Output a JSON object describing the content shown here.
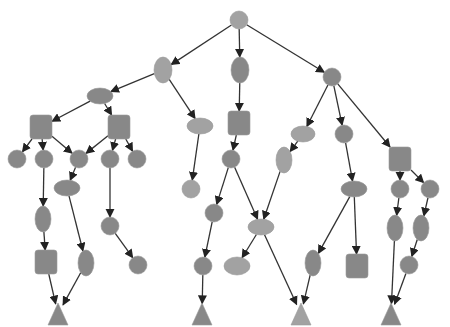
{
  "diagram": {
    "type": "tree",
    "colors": {
      "light": "#a2a2a2",
      "dark": "#888888",
      "edge": "#333333",
      "background": "#ffffff"
    },
    "nodes": [
      {
        "id": "root",
        "shape": "circle",
        "x": 239,
        "y": 20,
        "rx": 9,
        "ry": 9,
        "tone": "light"
      },
      {
        "id": "a",
        "shape": "ellipse",
        "x": 163,
        "y": 70,
        "rx": 9,
        "ry": 13,
        "tone": "light"
      },
      {
        "id": "b",
        "shape": "ellipse",
        "x": 240,
        "y": 70,
        "rx": 9,
        "ry": 13,
        "tone": "dark"
      },
      {
        "id": "c",
        "shape": "circle",
        "x": 332,
        "y": 77,
        "rx": 9,
        "ry": 9,
        "tone": "dark"
      },
      {
        "id": "a1",
        "shape": "ellipse",
        "x": 100,
        "y": 96,
        "rx": 13,
        "ry": 8,
        "tone": "dark"
      },
      {
        "id": "a2",
        "shape": "ellipse",
        "x": 200,
        "y": 126,
        "rx": 13,
        "ry": 8,
        "tone": "light"
      },
      {
        "id": "a1a",
        "shape": "square",
        "x": 41,
        "y": 127,
        "rx": 11,
        "ry": 12,
        "tone": "dark"
      },
      {
        "id": "a1b",
        "shape": "square",
        "x": 119,
        "y": 127,
        "rx": 11,
        "ry": 12,
        "tone": "dark"
      },
      {
        "id": "l1",
        "shape": "circle",
        "x": 17,
        "y": 159,
        "rx": 9,
        "ry": 9,
        "tone": "dark"
      },
      {
        "id": "l2",
        "shape": "circle",
        "x": 44,
        "y": 159,
        "rx": 9,
        "ry": 9,
        "tone": "dark"
      },
      {
        "id": "l3",
        "shape": "circle",
        "x": 79,
        "y": 159,
        "rx": 9,
        "ry": 9,
        "tone": "dark"
      },
      {
        "id": "l4",
        "shape": "circle",
        "x": 110,
        "y": 159,
        "rx": 9,
        "ry": 9,
        "tone": "dark"
      },
      {
        "id": "l5",
        "shape": "circle",
        "x": 137,
        "y": 159,
        "rx": 9,
        "ry": 9,
        "tone": "dark"
      },
      {
        "id": "l3c",
        "shape": "ellipse",
        "x": 67,
        "y": 188,
        "rx": 13,
        "ry": 8,
        "tone": "dark"
      },
      {
        "id": "l2c",
        "shape": "ellipse",
        "x": 43,
        "y": 219,
        "rx": 8,
        "ry": 13,
        "tone": "dark"
      },
      {
        "id": "l4c",
        "shape": "circle",
        "x": 110,
        "y": 226,
        "rx": 9,
        "ry": 9,
        "tone": "dark"
      },
      {
        "id": "l2cc",
        "shape": "square",
        "x": 46,
        "y": 262,
        "rx": 11,
        "ry": 12,
        "tone": "dark"
      },
      {
        "id": "l3cc",
        "shape": "ellipse",
        "x": 86,
        "y": 263,
        "rx": 8,
        "ry": 13,
        "tone": "dark"
      },
      {
        "id": "l4cc",
        "shape": "circle",
        "x": 138,
        "y": 265,
        "rx": 9,
        "ry": 9,
        "tone": "dark"
      },
      {
        "id": "t1",
        "shape": "triangle",
        "x": 58,
        "y": 314,
        "rx": 10,
        "ry": 11,
        "tone": "dark"
      },
      {
        "id": "a2c",
        "shape": "circle",
        "x": 191,
        "y": 189,
        "rx": 9,
        "ry": 9,
        "tone": "light"
      },
      {
        "id": "b1",
        "shape": "square",
        "x": 239,
        "y": 123,
        "rx": 11,
        "ry": 12,
        "tone": "dark"
      },
      {
        "id": "b1a",
        "shape": "circle",
        "x": 231,
        "y": 159,
        "rx": 9,
        "ry": 9,
        "tone": "dark"
      },
      {
        "id": "b1l",
        "shape": "circle",
        "x": 214,
        "y": 213,
        "rx": 9,
        "ry": 9,
        "tone": "dark"
      },
      {
        "id": "b1ll",
        "shape": "circle",
        "x": 203,
        "y": 266,
        "rx": 9,
        "ry": 9,
        "tone": "dark"
      },
      {
        "id": "t2",
        "shape": "triangle",
        "x": 202,
        "y": 314,
        "rx": 10,
        "ry": 11,
        "tone": "dark"
      },
      {
        "id": "mid",
        "shape": "ellipse",
        "x": 261,
        "y": 227,
        "rx": 13,
        "ry": 8,
        "tone": "light"
      },
      {
        "id": "midl",
        "shape": "ellipse",
        "x": 237,
        "y": 266,
        "rx": 13,
        "ry": 9,
        "tone": "light"
      },
      {
        "id": "c1",
        "shape": "ellipse",
        "x": 303,
        "y": 134,
        "rx": 12,
        "ry": 8,
        "tone": "light"
      },
      {
        "id": "c1c",
        "shape": "ellipse",
        "x": 284,
        "y": 160,
        "rx": 8,
        "ry": 13,
        "tone": "light"
      },
      {
        "id": "c2",
        "shape": "circle",
        "x": 344,
        "y": 134,
        "rx": 9,
        "ry": 9,
        "tone": "dark"
      },
      {
        "id": "c2c",
        "shape": "ellipse",
        "x": 354,
        "y": 189,
        "rx": 13,
        "ry": 8,
        "tone": "dark"
      },
      {
        "id": "c2cl",
        "shape": "ellipse",
        "x": 313,
        "y": 263,
        "rx": 8,
        "ry": 13,
        "tone": "dark"
      },
      {
        "id": "c2cr",
        "shape": "square",
        "x": 357,
        "y": 266,
        "rx": 11,
        "ry": 12,
        "tone": "dark"
      },
      {
        "id": "t3",
        "shape": "triangle",
        "x": 301,
        "y": 314,
        "rx": 10,
        "ry": 11,
        "tone": "light"
      },
      {
        "id": "c3",
        "shape": "square",
        "x": 400,
        "y": 159,
        "rx": 11,
        "ry": 12,
        "tone": "dark"
      },
      {
        "id": "c3a",
        "shape": "circle",
        "x": 400,
        "y": 189,
        "rx": 9,
        "ry": 9,
        "tone": "dark"
      },
      {
        "id": "c3b",
        "shape": "circle",
        "x": 430,
        "y": 189,
        "rx": 9,
        "ry": 9,
        "tone": "dark"
      },
      {
        "id": "c3ac",
        "shape": "ellipse",
        "x": 395,
        "y": 228,
        "rx": 8,
        "ry": 13,
        "tone": "dark"
      },
      {
        "id": "c3bc",
        "shape": "ellipse",
        "x": 421,
        "y": 228,
        "rx": 8,
        "ry": 13,
        "tone": "dark"
      },
      {
        "id": "c3bcc",
        "shape": "circle",
        "x": 409,
        "y": 265,
        "rx": 9,
        "ry": 9,
        "tone": "dark"
      },
      {
        "id": "t4",
        "shape": "triangle",
        "x": 391,
        "y": 314,
        "rx": 10,
        "ry": 11,
        "tone": "dark"
      }
    ],
    "edges": [
      [
        "root",
        "a"
      ],
      [
        "root",
        "b"
      ],
      [
        "root",
        "c"
      ],
      [
        "a",
        "a1"
      ],
      [
        "a",
        "a2"
      ],
      [
        "a1",
        "a1a"
      ],
      [
        "a1",
        "a1b"
      ],
      [
        "a1a",
        "l1"
      ],
      [
        "a1a",
        "l2"
      ],
      [
        "a1a",
        "l3"
      ],
      [
        "a1b",
        "l3"
      ],
      [
        "a1b",
        "l4"
      ],
      [
        "a1b",
        "l5"
      ],
      [
        "l3",
        "l3c"
      ],
      [
        "l2",
        "l2c"
      ],
      [
        "l4",
        "l4c"
      ],
      [
        "l2c",
        "l2cc"
      ],
      [
        "l3c",
        "l3cc"
      ],
      [
        "l4c",
        "l4cc"
      ],
      [
        "l2cc",
        "t1"
      ],
      [
        "l3cc",
        "t1"
      ],
      [
        "a2",
        "a2c"
      ],
      [
        "b",
        "b1"
      ],
      [
        "b1",
        "b1a"
      ],
      [
        "b1a",
        "b1l"
      ],
      [
        "b1a",
        "mid"
      ],
      [
        "b1l",
        "b1ll"
      ],
      [
        "b1ll",
        "t2"
      ],
      [
        "mid",
        "midl"
      ],
      [
        "mid",
        "t3"
      ],
      [
        "c",
        "c1"
      ],
      [
        "c",
        "c2"
      ],
      [
        "c",
        "c3"
      ],
      [
        "c1",
        "c1c"
      ],
      [
        "c1c",
        "mid"
      ],
      [
        "c2",
        "c2c"
      ],
      [
        "c2c",
        "c2cl"
      ],
      [
        "c2c",
        "c2cr"
      ],
      [
        "c2cl",
        "t3"
      ],
      [
        "c3",
        "c3a"
      ],
      [
        "c3",
        "c3b"
      ],
      [
        "c3a",
        "c3ac"
      ],
      [
        "c3b",
        "c3bc"
      ],
      [
        "c3bc",
        "c3bcc"
      ],
      [
        "c3ac",
        "t4"
      ],
      [
        "c3bcc",
        "t4"
      ]
    ]
  }
}
